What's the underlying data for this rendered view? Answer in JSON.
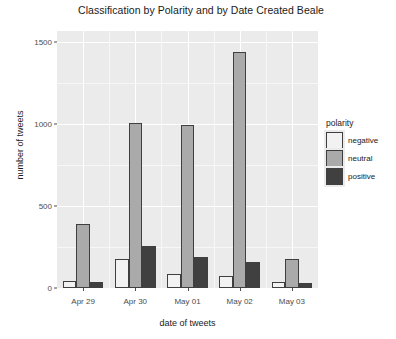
{
  "chart_data": {
    "type": "bar",
    "title": "Classification by Polarity and by Date Created Beale",
    "xlabel": "date of tweets",
    "ylabel": "number of tweets",
    "categories": [
      "Apr 29",
      "Apr 30",
      "May 01",
      "May 02",
      "May 03"
    ],
    "series": [
      {
        "name": "negative",
        "color": "#f2f2f2",
        "values": [
          40,
          175,
          85,
          75,
          35
        ]
      },
      {
        "name": "neutral",
        "color": "#aaaaaa",
        "values": [
          390,
          1010,
          995,
          1440,
          175
        ]
      },
      {
        "name": "positive",
        "color": "#404040",
        "values": [
          35,
          255,
          190,
          160,
          30
        ]
      }
    ],
    "legend": {
      "title": "polarity",
      "position": "right",
      "entries": [
        "negative",
        "neutral",
        "positive"
      ]
    },
    "yticks": [
      0,
      500,
      1000,
      1500
    ],
    "ytick_labels": [
      "0",
      "500",
      "1000",
      "1500"
    ],
    "ylim": [
      0,
      1570
    ],
    "grid": true,
    "panel_background": "#ebebeb",
    "gridline_color": "#ffffff",
    "bar_outline_color": "#3f3f3f"
  }
}
